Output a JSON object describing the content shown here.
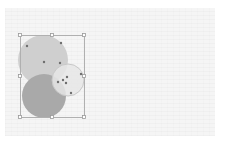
{
  "canvas": {
    "background": "#f5f5f5"
  },
  "shapes": [
    {
      "name": "circle-top",
      "cx": 43,
      "cy": 60,
      "r": 25,
      "fill": "#cfcfcf",
      "stroke": "none"
    },
    {
      "name": "circle-bottom",
      "cx": 44,
      "cy": 96,
      "r": 22,
      "fill": "#a9a9a9",
      "stroke": "none"
    },
    {
      "name": "circle-right",
      "cx": 68,
      "cy": 80,
      "r": 16,
      "fill": "#e6e6e6",
      "stroke": "#c8c8c8",
      "opacity": 0.85
    }
  ],
  "selection": {
    "x": 20,
    "y": 35,
    "width": 64,
    "height": 82,
    "stroke": "#b0b0b0",
    "handles": [
      "top-left",
      "top-center",
      "top-right",
      "middle-left",
      "middle-right",
      "bottom-left",
      "bottom-center",
      "bottom-right"
    ]
  },
  "control_points": [
    [
      27,
      46
    ],
    [
      61,
      43
    ],
    [
      44,
      62
    ],
    [
      60,
      63
    ],
    [
      63,
      80
    ],
    [
      58,
      82
    ],
    [
      66,
      83
    ],
    [
      67,
      77
    ],
    [
      81,
      74
    ],
    [
      71,
      93
    ]
  ]
}
